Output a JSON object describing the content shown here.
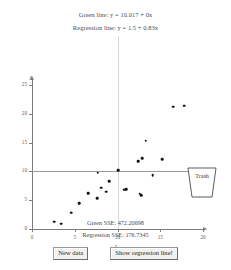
{
  "header": {
    "green_equation": "Green line:  y = 10.017 + 0x",
    "regression_equation": "Regression line:  y = 1.5 + 0.83x"
  },
  "footer": {
    "green_sse": "Green SSE: 472.20698",
    "regression_sse": "Regression SSE: 176.7345"
  },
  "buttons": {
    "new_data": "New data",
    "show_regression": "Show regression line!"
  },
  "trash": {
    "label": "Trash"
  },
  "colors": {
    "point": "#111111",
    "axis": "#7d7d7d",
    "green_line": "#9a9a9a",
    "guide": "#d8d8d8",
    "button_face": "#f1f1f1"
  },
  "chart_data": {
    "type": "scatter",
    "title": "",
    "xlabel": "x",
    "ylabel": "y",
    "xlim": [
      0,
      20
    ],
    "ylim": [
      0,
      25
    ],
    "xticks": [
      0,
      5,
      10,
      15,
      20
    ],
    "yticks": [
      0,
      5,
      10,
      15,
      20,
      25
    ],
    "grid": false,
    "legend": "none",
    "points": [
      {
        "x": 2.6,
        "y": 1.3
      },
      {
        "x": 3.4,
        "y": 0.9
      },
      {
        "x": 4.6,
        "y": 2.8
      },
      {
        "x": 5.5,
        "y": 4.5
      },
      {
        "x": 6.6,
        "y": 6.2
      },
      {
        "x": 7.6,
        "y": 5.3
      },
      {
        "x": 8.1,
        "y": 7.2
      },
      {
        "x": 8.7,
        "y": 6.5
      },
      {
        "x": 9.0,
        "y": 8.3
      },
      {
        "x": 7.7,
        "y": 9.8
      },
      {
        "x": 10.1,
        "y": 10.2
      },
      {
        "x": 10.8,
        "y": 6.8
      },
      {
        "x": 11.0,
        "y": 6.9
      },
      {
        "x": 12.6,
        "y": 6.1
      },
      {
        "x": 12.8,
        "y": 5.9
      },
      {
        "x": 12.4,
        "y": 11.8
      },
      {
        "x": 12.9,
        "y": 12.3
      },
      {
        "x": 13.3,
        "y": 15.3
      },
      {
        "x": 14.1,
        "y": 9.3
      },
      {
        "x": 15.2,
        "y": 12.1
      },
      {
        "x": 16.5,
        "y": 21.2
      },
      {
        "x": 17.8,
        "y": 21.4
      }
    ],
    "lines": [
      {
        "name": "green-line",
        "type": "horizontal",
        "y": 10.017,
        "equation": "y = 10.017 + 0x"
      },
      {
        "name": "regression-line",
        "type": "linear",
        "intercept": 1.5,
        "slope": 0.83,
        "equation": "y = 1.5 + 0.83x",
        "visible": false
      }
    ],
    "guides": [
      {
        "name": "vertical-guide",
        "x": 10
      }
    ],
    "stats": {
      "green_sse": 472.20698,
      "regression_sse": 176.7345
    }
  }
}
